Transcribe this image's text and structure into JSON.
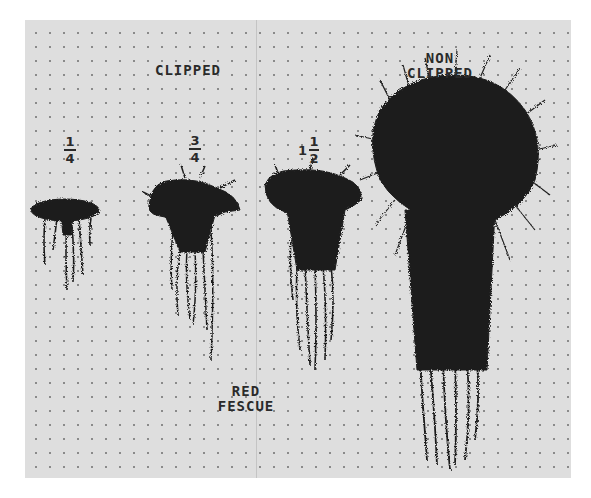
{
  "photo": {
    "subject": "Red fescue root and shoot growth under different clipping treatments",
    "header_labels": {
      "clipped": "CLIPPED",
      "non_clipped_line1": "NON",
      "non_clipped_line2": "CLIPPED"
    },
    "treatments": [
      {
        "label_whole": "",
        "label_num": "1",
        "label_den": "4",
        "description": "1/4 clipped"
      },
      {
        "label_whole": "",
        "label_num": "3",
        "label_den": "4",
        "description": "3/4 clipped"
      },
      {
        "label_whole": "1",
        "label_num": "1",
        "label_den": "2",
        "description": "1 1/2 clipped"
      },
      {
        "label_whole": "",
        "label_num": "",
        "label_den": "",
        "description": "non clipped"
      }
    ],
    "species_label_line1": "RED",
    "species_label_line2": "FESCUE",
    "colors": {
      "background": "#dedede",
      "dot": "#8a8a8a",
      "plant": "#1e1e1e",
      "text": "#2a2a2a"
    }
  }
}
